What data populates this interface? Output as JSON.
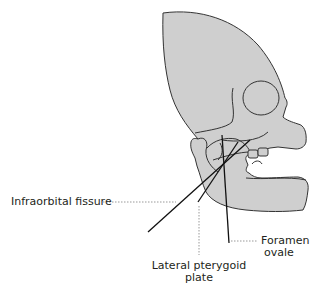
{
  "diagram": {
    "colors": {
      "bone_fill": "#cfcfcf",
      "outline": "#333333",
      "leader": "#999999"
    },
    "labels": {
      "infraorbital_fissure": "Infraorbital fissure",
      "foramen_ovale_line1": "Foramen",
      "foramen_ovale_line2": "ovale",
      "lateral_pterygoid_line1": "Lateral pterygoid",
      "lateral_pterygoid_line2": "plate"
    }
  }
}
